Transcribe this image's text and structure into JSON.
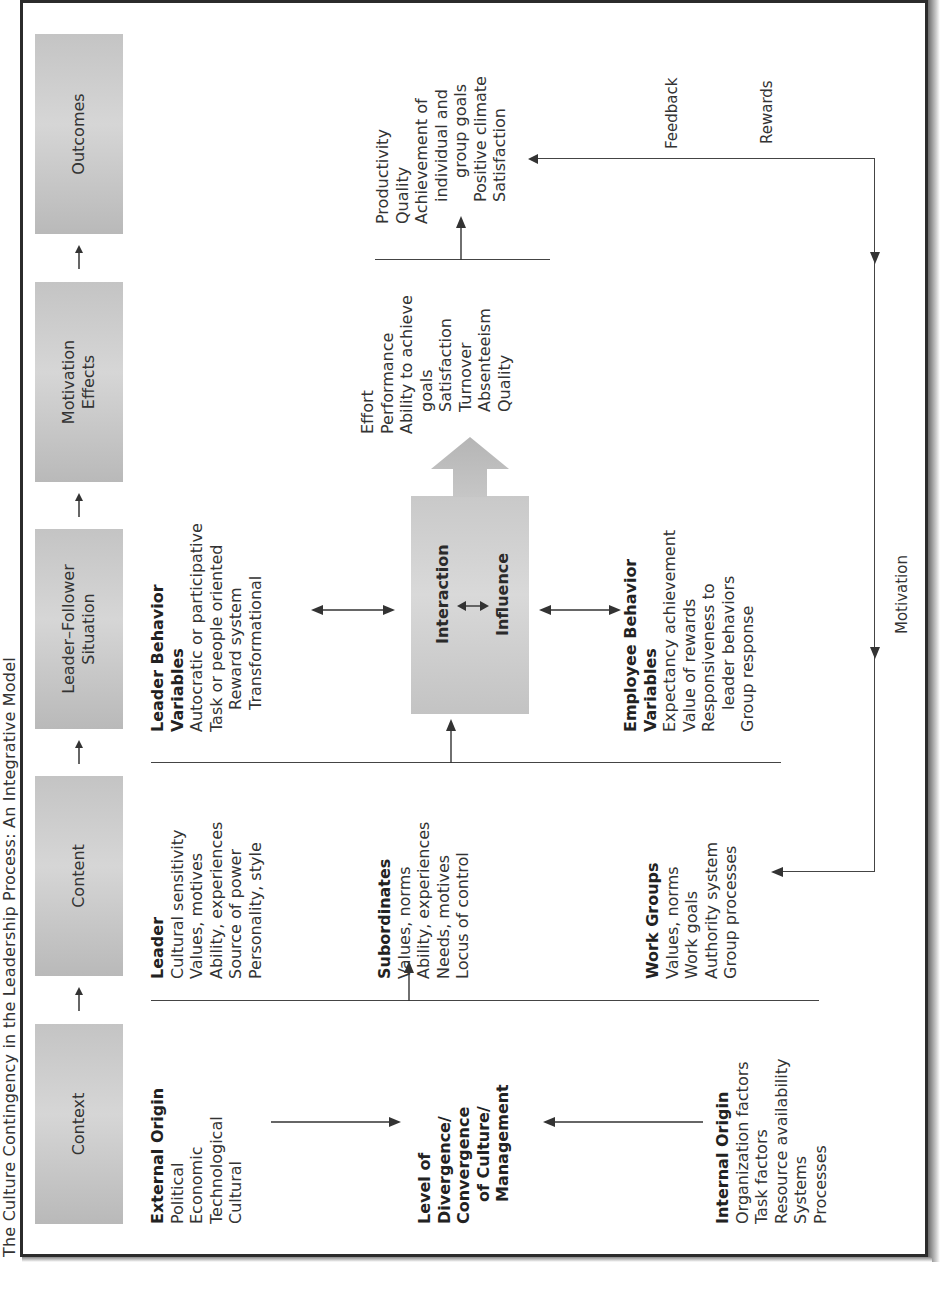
{
  "title": "The Culture Contingency in the Leadership Process: An Integrative Model",
  "stages": [
    {
      "label_lines": [
        "Context"
      ]
    },
    {
      "label_lines": [
        "Content"
      ]
    },
    {
      "label_lines": [
        "Leader–Follower",
        "Situation"
      ]
    },
    {
      "label_lines": [
        "Motivation",
        "Effects"
      ]
    },
    {
      "label_lines": [
        "Outcomes"
      ]
    }
  ],
  "context": {
    "external": {
      "heading": "External Origin",
      "items": [
        "Political",
        "Economic",
        "Technological",
        "Cultural"
      ]
    },
    "level": {
      "lines": [
        "Level of",
        "Divergence/",
        "Convergence",
        "of Culture/",
        "Management"
      ]
    },
    "internal": {
      "heading": "Internal Origin",
      "items": [
        "Organization factors",
        "Task factors",
        "Resource availability",
        "Systems",
        "Processes"
      ]
    }
  },
  "content": {
    "leader": {
      "heading": "Leader",
      "items": [
        "Cultural sensitivity",
        "Values, motives",
        "Ability, experiences",
        "Source of power",
        "Personality, style"
      ]
    },
    "subordinates": {
      "heading": "Subordinates",
      "items": [
        "Values, norms",
        "Ability, experiences",
        "Needs, motives",
        "Locus of control"
      ]
    },
    "work_groups": {
      "heading": "Work Groups",
      "items": [
        "Values, norms",
        "Work goals",
        "Authority system",
        "Group processes"
      ]
    }
  },
  "situation": {
    "leader_behavior": {
      "heading_lines": [
        "Leader Behavior",
        "Variables"
      ],
      "items": [
        "Autocratic or participative",
        "Task or people oriented",
        "Reward system",
        "Transformational"
      ]
    },
    "interaction_box": {
      "top": "Interaction",
      "bottom": "Influence"
    },
    "employee_behavior": {
      "heading_lines": [
        "Employee Behavior",
        "Variables"
      ],
      "items": [
        "Expectancy achievement",
        "Value of rewards",
        "Responsiveness to",
        "leader behaviors",
        "Group response"
      ]
    }
  },
  "motivation_effects": {
    "items": [
      "Effort",
      "Performance",
      "Ability to achieve",
      "goals",
      "Satisfaction",
      "Turnover",
      "Absenteeism",
      "Quality"
    ]
  },
  "outcomes": {
    "items": [
      "Productivity",
      "Quality",
      "Achievement of",
      "individual and",
      "group goals",
      "Positive climate",
      "Satisfaction"
    ]
  },
  "feedback_loop": {
    "motivation_label": "Motivation",
    "feedback_label": "Feedback",
    "rewards_label": "Rewards"
  }
}
